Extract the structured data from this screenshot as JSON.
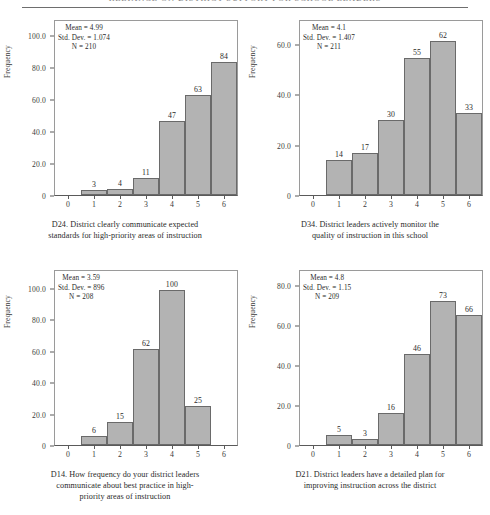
{
  "header": {
    "text": "RELIANCE ON DISTRICT SUPPORT FOR SCHOOL LEADERS"
  },
  "common": {
    "ylabel": "Frequency",
    "mean_prefix": "Mean = ",
    "sd_prefix": "Std. Dev. = ",
    "n_prefix": "N = "
  },
  "chart_data": [
    {
      "type": "bar",
      "id": "D24",
      "title": "D24. District clearly communicate expected standards for high-priority areas of instruction",
      "caption_lines": [
        "D24. District clearly communicate expected",
        "standards for high-priority areas of instruction"
      ],
      "xlabel": "",
      "ylabel": "Frequency",
      "categories": [
        "0",
        "1",
        "2",
        "3",
        "4",
        "5",
        "6"
      ],
      "values": [
        0,
        3,
        4,
        11,
        47,
        63,
        84
      ],
      "bar_labels": [
        "",
        "3",
        "4",
        "11",
        "47",
        "63",
        "84"
      ],
      "yticks": [
        "0",
        "20.0",
        "40.0",
        "60.0",
        "80.0",
        "100.0"
      ],
      "ytick_values": [
        0,
        20,
        40,
        60,
        80,
        100
      ],
      "ylim": [
        0,
        110
      ],
      "xlim": [
        -0.5,
        6.5
      ],
      "grid": false,
      "legend": "none",
      "stats": {
        "mean": "4.99",
        "std_dev": "1.074",
        "n": "210"
      }
    },
    {
      "type": "bar",
      "id": "D34",
      "title": "D34. District leaders actively monitor the quality of instruction in this school",
      "caption_lines": [
        "D34. District leaders actively monitor the",
        "quality of instruction in this school"
      ],
      "xlabel": "",
      "ylabel": "Frequency",
      "categories": [
        "0",
        "1",
        "2",
        "3",
        "4",
        "5",
        "6"
      ],
      "values": [
        0,
        14,
        17,
        30,
        55,
        62,
        33
      ],
      "bar_labels": [
        "",
        "14",
        "17",
        "30",
        "55",
        "62",
        "33"
      ],
      "yticks": [
        "0",
        "20.0",
        "40.0",
        "60.0"
      ],
      "ytick_values": [
        0,
        20,
        40,
        60
      ],
      "ylim": [
        0,
        70
      ],
      "xlim": [
        -0.5,
        6.5
      ],
      "grid": false,
      "legend": "none",
      "stats": {
        "mean": "4.1",
        "std_dev": "1.407",
        "n": "211"
      }
    },
    {
      "type": "bar",
      "id": "D14",
      "title": "D14. How frequency do your district leaders communicate about best practice in high-priority areas of instruction",
      "caption_lines": [
        "D14. How frequency do your district leaders",
        "communicate about best practice in high-",
        "priority areas of instruction"
      ],
      "xlabel": "",
      "ylabel": "Frequency",
      "categories": [
        "0",
        "1",
        "2",
        "3",
        "4",
        "5",
        "6"
      ],
      "values": [
        0,
        6,
        15,
        62,
        100,
        25,
        0
      ],
      "bar_labels": [
        "",
        "6",
        "15",
        "62",
        "100",
        "25",
        ""
      ],
      "yticks": [
        "0",
        "20.0",
        "40.0",
        "60.0",
        "80.0",
        "100.0"
      ],
      "ytick_values": [
        0,
        20,
        40,
        60,
        80,
        100
      ],
      "ylim": [
        0,
        112
      ],
      "xlim": [
        -0.5,
        6.5
      ],
      "grid": false,
      "legend": "none",
      "stats": {
        "mean": "3.59",
        "std_dev": "896",
        "n": "208"
      }
    },
    {
      "type": "bar",
      "id": "D21",
      "title": "D21. District leaders have a detailed plan for improving instruction across the district",
      "caption_lines": [
        "D21. District leaders have a detailed plan for",
        "improving instruction across the district"
      ],
      "xlabel": "",
      "ylabel": "Frequency",
      "categories": [
        "0",
        "1",
        "2",
        "3",
        "4",
        "5",
        "6"
      ],
      "values": [
        0,
        5,
        3,
        16,
        46,
        73,
        66
      ],
      "bar_labels": [
        "",
        "5",
        "3",
        "16",
        "46",
        "73",
        "66"
      ],
      "yticks": [
        "0",
        "20.0",
        "40.0",
        "60.0",
        "80.0"
      ],
      "ytick_values": [
        0,
        20,
        40,
        60,
        80
      ],
      "ylim": [
        0,
        88
      ],
      "xlim": [
        -0.5,
        6.5
      ],
      "grid": false,
      "legend": "none",
      "stats": {
        "mean": "4.8",
        "std_dev": "1.15",
        "n": "209"
      }
    }
  ]
}
